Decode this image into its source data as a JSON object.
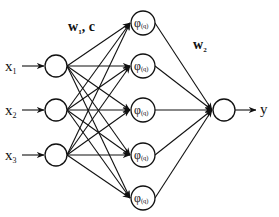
{
  "diagram": {
    "type": "rbf-neural-network",
    "inputs": [
      {
        "label": "x",
        "sub": "1"
      },
      {
        "label": "x",
        "sub": "2"
      },
      {
        "label": "x",
        "sub": "3"
      }
    ],
    "hidden_nodes": [
      {
        "label": "φ",
        "sub": "(q)"
      },
      {
        "label": "φ",
        "sub": "(q)"
      },
      {
        "label": "φ",
        "sub": "(q)"
      },
      {
        "label": "φ",
        "sub": "(q)"
      },
      {
        "label": "φ",
        "sub": "(q)"
      }
    ],
    "output": {
      "label": "y"
    },
    "weights_layer1": {
      "label": "w",
      "sub": "1",
      "suffix": ", c"
    },
    "weights_layer2": {
      "label": "w",
      "sub": "2"
    },
    "colors": {
      "line": "#111111",
      "background": "#ffffff"
    }
  }
}
